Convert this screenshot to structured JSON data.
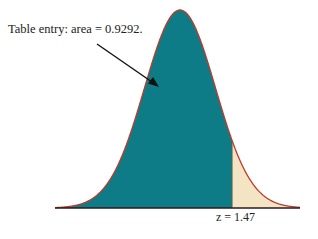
{
  "chart_data": {
    "type": "area",
    "title": "",
    "distribution": "standard normal",
    "shaded_left_area": 0.9292,
    "z_value": 1.47,
    "annotation": "Table entry: area = 0.9292.",
    "z_label": "z = 1.47",
    "xlabel": "",
    "ylabel": "",
    "grid": false,
    "colors": {
      "left_region": "#0e7c86",
      "right_region": "#f3e5c3",
      "curve": "#c0392b",
      "baseline": "#2a1a1a",
      "arrow": "#111111"
    }
  }
}
